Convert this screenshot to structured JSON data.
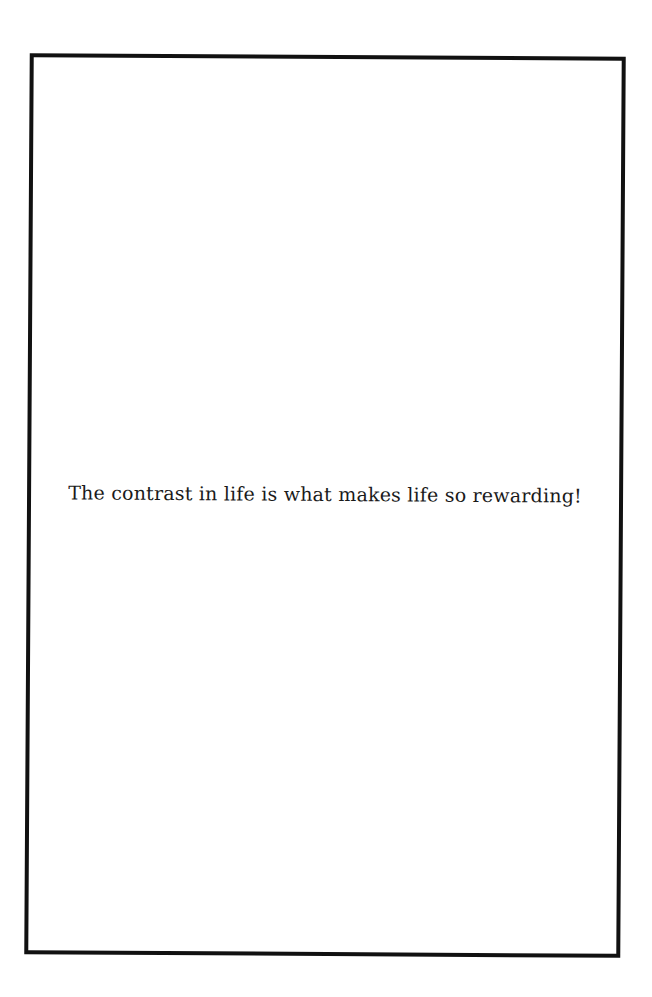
{
  "page": {
    "quote": "The contrast in life is what makes life so rewarding!",
    "border_color": "#111111",
    "background_color": "#ffffff"
  }
}
